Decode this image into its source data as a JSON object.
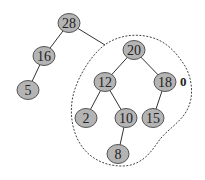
{
  "diagram": {
    "type": "binary-tree",
    "nodes": [
      {
        "id": "n28",
        "label": "28",
        "x": 69,
        "y": 23
      },
      {
        "id": "n16",
        "label": "16",
        "x": 44,
        "y": 56
      },
      {
        "id": "n5",
        "label": "5",
        "x": 28,
        "y": 90
      },
      {
        "id": "n20",
        "label": "20",
        "x": 134,
        "y": 50
      },
      {
        "id": "n12",
        "label": "12",
        "x": 105,
        "y": 82
      },
      {
        "id": "n18",
        "label": "18",
        "x": 165,
        "y": 82
      },
      {
        "id": "n2",
        "label": "2",
        "x": 86,
        "y": 118
      },
      {
        "id": "n10",
        "label": "10",
        "x": 126,
        "y": 118
      },
      {
        "id": "n15",
        "label": "15",
        "x": 153,
        "y": 118
      },
      {
        "id": "n8",
        "label": "8",
        "x": 118,
        "y": 154
      }
    ],
    "edges": [
      [
        "28",
        "16"
      ],
      [
        "16",
        "5"
      ],
      [
        "28",
        "subtree"
      ],
      [
        "20",
        "12"
      ],
      [
        "20",
        "18"
      ],
      [
        "12",
        "2"
      ],
      [
        "12",
        "10"
      ],
      [
        "10",
        "8"
      ],
      [
        "18",
        "15"
      ]
    ],
    "annotation": {
      "text": "0",
      "x": 180,
      "y": 82,
      "attached_to": "18"
    },
    "subtree_outline": "dashed outline enclosing subtree rooted at 20"
  }
}
